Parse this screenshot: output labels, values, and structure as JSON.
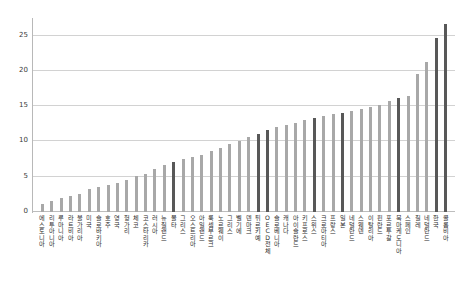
{
  "chart_data": {
    "type": "bar",
    "title": "",
    "subtitle": "",
    "xlabel": "",
    "ylabel": "",
    "ylim": [
      0,
      27.5
    ],
    "yticks": [
      0,
      5,
      10,
      15,
      20,
      25
    ],
    "ytick_labels": [
      "0",
      "5",
      "10",
      "15",
      "20",
      "25"
    ],
    "grid": "horizontal",
    "legend": "none",
    "orientation": "vertical",
    "bar_colors": {
      "normal": "#a8a8a8",
      "highlight": "#585858"
    },
    "categories": [
      "에스토니아",
      "리투아니아",
      "루마니아",
      "라트비아",
      "불가리아",
      "미국",
      "슬로바키아",
      "호주",
      "영국",
      "헝가리",
      "체코",
      "코스타리카",
      "러시아",
      "뉴질랜드",
      "몰타",
      "그리스",
      "오스트리아",
      "아일랜드",
      "룩셈부르크",
      "노르웨이",
      "그리스",
      "벨기에",
      "덴마크",
      "튀르키예",
      "OECD 전체",
      "슬로베니아",
      "캐나다",
      "아이슬란드",
      "키프로스",
      "스위스",
      "크로아티아",
      "프랑스",
      "일본",
      "네덜란드",
      "스웨덴",
      "이탈리아",
      "핀란드",
      "포르투갈",
      "북마케도니아",
      "스페인",
      "칠레",
      "네덜란드",
      "한국",
      "콜롬비아"
    ],
    "values": [
      1.2,
      1.6,
      2.0,
      2.3,
      2.6,
      3.3,
      3.6,
      3.9,
      4.1,
      4.6,
      5.1,
      5.4,
      6.1,
      6.6,
      7.1,
      7.5,
      7.8,
      8.1,
      8.6,
      9.1,
      9.6,
      10.1,
      10.6,
      11.1,
      11.6,
      12.0,
      12.3,
      12.6,
      13.0,
      13.3,
      13.6,
      13.9,
      14.1,
      14.3,
      14.6,
      14.9,
      15.2,
      15.8,
      16.1,
      16.4,
      19.6,
      21.2,
      24.6,
      26.6
    ],
    "highlighted": [
      false,
      false,
      false,
      false,
      false,
      false,
      false,
      false,
      false,
      false,
      false,
      false,
      false,
      false,
      true,
      false,
      false,
      false,
      false,
      false,
      false,
      false,
      false,
      true,
      true,
      false,
      false,
      false,
      false,
      true,
      false,
      false,
      true,
      false,
      false,
      false,
      false,
      false,
      true,
      false,
      false,
      false,
      true,
      true
    ]
  }
}
